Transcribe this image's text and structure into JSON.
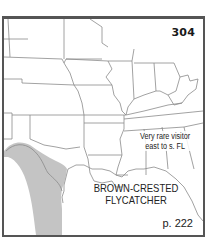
{
  "map": {
    "plate_number": "304",
    "species": {
      "line1": "BROWN-CRESTED",
      "line2": "FLYCATCHER"
    },
    "note": {
      "line1": "Very rare visitor",
      "line2": "east to s. FL"
    },
    "page_reference": "p. 222",
    "colors": {
      "frame": "#555555",
      "borders": "#8a8a8a",
      "range_fill": "#c4c4c4",
      "text": "#222222"
    },
    "legend_ranges": [
      {
        "type": "breeding/summer range",
        "region": "south Texas and northeast Mexico",
        "color": "#c4c4c4"
      }
    ]
  }
}
